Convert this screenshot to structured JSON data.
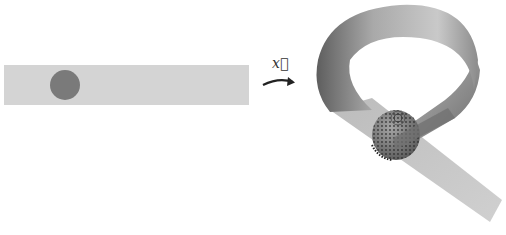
{
  "figure": {
    "left_panel": {
      "description": "flat strip with disk",
      "strip_color": "#d4d4d4",
      "disk_color": "#7a7a7a"
    },
    "mapping": {
      "label": "x⃗",
      "label_text": "x",
      "arrow": "curved-arrow"
    },
    "right_panel": {
      "description": "strip embedded as looped 3D ribbon with deformed sphere",
      "ribbon_light": "#d6d6d6",
      "ribbon_dark": "#6e6e6e",
      "sphere_color": "#8a8a8a",
      "dot_color": "#2a2a2a"
    }
  }
}
